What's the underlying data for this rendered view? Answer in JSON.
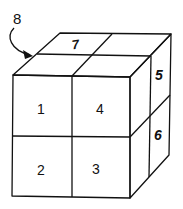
{
  "diagram": {
    "type": "2x2x2 cube of numbered blocks",
    "callout_label": "8",
    "cubes": {
      "front_top_left": "1",
      "front_bottom_left": "2",
      "front_bottom_right": "3",
      "front_top_right": "4",
      "right_top": "5",
      "right_bottom": "6",
      "top_back_left": "7"
    },
    "colors": {
      "line": "#111111",
      "background": "#ffffff"
    }
  }
}
